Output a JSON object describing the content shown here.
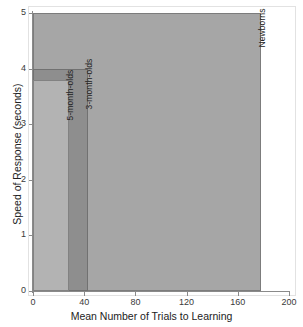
{
  "chart_data": {
    "type": "bar",
    "orientation": "horizontal-overlaid",
    "title": "",
    "xlabel": "Mean Number of Trials to Learning",
    "ylabel": "Speed of Response (seconds)",
    "xlim": [
      0,
      200
    ],
    "ylim": [
      0,
      5
    ],
    "xticks": [
      "0",
      "40",
      "80",
      "120",
      "160",
      "200"
    ],
    "xtick_values": [
      0,
      40,
      80,
      120,
      160,
      200
    ],
    "yticks": [
      "0",
      "1",
      "2",
      "3",
      "4",
      "5"
    ],
    "ytick_values": [
      0,
      1,
      2,
      3,
      4,
      5
    ],
    "grid": false,
    "legend": "none (labels drawn inside bars)",
    "categories": [
      "Newborns",
      "3-month-olds",
      "5-month-olds"
    ],
    "series": [
      {
        "name": "Newborns",
        "trials": 178,
        "speed_seconds": 5,
        "color": "#a6a6a6",
        "label": "Newborns"
      },
      {
        "name": "3-month-olds",
        "trials": 43,
        "speed_seconds": 4,
        "color": "#8e8e8e",
        "label": "3-month-olds"
      },
      {
        "name": "5-month-olds",
        "trials": 28,
        "speed_seconds": 3.8,
        "color": "#b3b3b3",
        "label": "5-month-olds"
      }
    ]
  },
  "colors": {
    "background": "#ffffff",
    "axis": "#8a8a8a",
    "frame": "#e2e2e2",
    "text": "#222222"
  }
}
